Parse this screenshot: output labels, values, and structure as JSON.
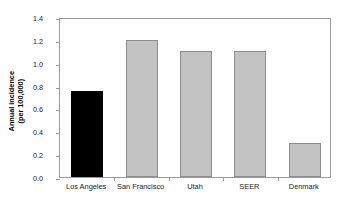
{
  "chart_data": {
    "type": "bar",
    "title": "",
    "xlabel": "",
    "ylabel_line1": "Annual incidence",
    "ylabel_line2": "(per 100,000)",
    "ylabel": "Annual incidence (per 100,000)",
    "categories": [
      "Los Angeles",
      "San Francisco",
      "Utah",
      "SEER",
      "Denmark"
    ],
    "values": [
      0.75,
      1.2,
      1.1,
      1.1,
      0.3
    ],
    "ylim": [
      0.0,
      1.4
    ],
    "ytick_labels": [
      "0.0",
      "0.2",
      "0.4",
      "0.6",
      "0.8",
      "1.0",
      "1.2",
      "1.4"
    ],
    "ytick_values": [
      0.0,
      0.2,
      0.4,
      0.6,
      0.8,
      1.0,
      1.2,
      1.4
    ],
    "grid": false,
    "legend": "none",
    "bar_colors": [
      "#000000",
      "#c3c3c3",
      "#c3c3c3",
      "#c3c3c3",
      "#c3c3c3"
    ],
    "bar_edge_colors": [
      "#000000",
      "#8d8d8d",
      "#8d8d8d",
      "#8d8d8d",
      "#8d8d8d"
    ],
    "highlight_category": "Los Angeles",
    "background_color": "#ffffff",
    "frame_color": "#9a9a9a"
  }
}
